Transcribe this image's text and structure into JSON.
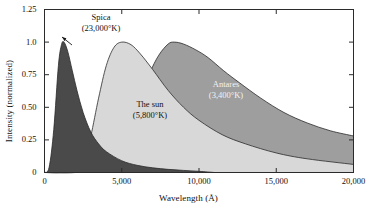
{
  "chart_data": {
    "type": "area",
    "title": "",
    "xlabel": "Wavelength (Å)",
    "ylabel": "Intensity (normalized)",
    "xlim": [
      0,
      20000
    ],
    "ylim": [
      0,
      1.25
    ],
    "grid": false,
    "legend": "inline-annotations",
    "xticks": [
      0,
      5000,
      10000,
      15000,
      20000
    ],
    "xtick_labels": [
      "0",
      "5,000",
      "10,000",
      "15,000",
      "20,000"
    ],
    "yticks": [
      0,
      0.25,
      0.5,
      0.75,
      1.0,
      1.25
    ],
    "ytick_labels": [
      "0",
      "0.25",
      "0.50",
      "0.75",
      "1.0",
      "1.25"
    ],
    "series": [
      {
        "name": "Spica",
        "temperature": "23,000°K",
        "label_line1": "Spica",
        "label_line2": "(23,000°K)",
        "color": "#4a4a4a",
        "peak_wavelength": 1260,
        "x": [
          0,
          300,
          600,
          900,
          1100,
          1260,
          1500,
          1800,
          2100,
          2500,
          3000,
          3500,
          4000,
          5000,
          6000,
          7000,
          8000,
          9000,
          10000,
          11000
        ],
        "values": [
          0.0,
          0.04,
          0.33,
          0.82,
          0.98,
          1.0,
          0.93,
          0.78,
          0.63,
          0.46,
          0.31,
          0.22,
          0.16,
          0.09,
          0.055,
          0.036,
          0.024,
          0.016,
          0.009,
          0.0
        ]
      },
      {
        "name": "The sun",
        "temperature": "5,800°K",
        "label_line1": "The sun",
        "label_line2": "(5,800°K)",
        "color": "#d8d8d8",
        "peak_wavelength": 5000,
        "x": [
          0,
          1000,
          2000,
          2600,
          3000,
          3500,
          4000,
          4500,
          5000,
          5600,
          6200,
          7000,
          8000,
          9000,
          10000,
          11500,
          13000,
          15000,
          17000,
          20000
        ],
        "values": [
          0.0,
          0.0,
          0.02,
          0.1,
          0.28,
          0.57,
          0.82,
          0.96,
          1.0,
          0.98,
          0.91,
          0.79,
          0.63,
          0.5,
          0.4,
          0.29,
          0.22,
          0.15,
          0.105,
          0.062
        ]
      },
      {
        "name": "Antares",
        "temperature": "3,400°K",
        "label_line1": "Antares",
        "label_line2": "(3,400°K)",
        "color": "#9e9e9e",
        "peak_wavelength": 8400,
        "x": [
          0,
          2000,
          4000,
          5000,
          5600,
          6200,
          6800,
          7400,
          8000,
          8400,
          9000,
          9800,
          10600,
          11600,
          12600,
          14000,
          15500,
          17000,
          18500,
          20000
        ],
        "values": [
          0.0,
          0.0,
          0.04,
          0.18,
          0.36,
          0.57,
          0.76,
          0.9,
          0.985,
          1.0,
          0.985,
          0.94,
          0.88,
          0.78,
          0.69,
          0.57,
          0.46,
          0.38,
          0.32,
          0.28
        ]
      }
    ]
  },
  "axes": {
    "x_title": "Wavelength (Å)",
    "y_title": "Intensity (normalized)"
  }
}
